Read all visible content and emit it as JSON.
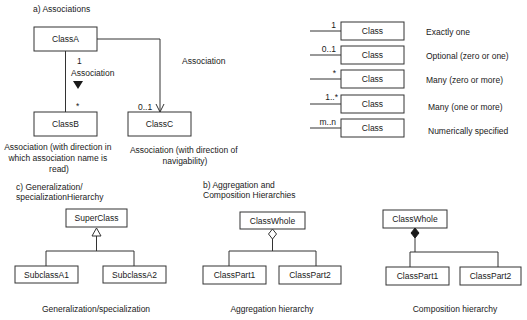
{
  "sections": {
    "associations": {
      "title": "a) Associations",
      "classA": "ClassA",
      "classB": "ClassB",
      "classC": "ClassC",
      "ab_multiplicity_top": "1",
      "ab_multiplicity_bottom": "*",
      "ab_association_label": "Association",
      "ac_association_label": "Association",
      "ac_multiplicity": "0..1",
      "caption_left": [
        "Association (with direction in",
        "which association name is",
        "read)"
      ],
      "caption_right": [
        "Association (with direction of",
        "navigability)"
      ]
    },
    "multiplicities": {
      "rows": [
        {
          "multiplicity": "1",
          "class": "Class",
          "meaning": "Exactly one"
        },
        {
          "multiplicity": "0..1",
          "class": "Class",
          "meaning": "Optional (zero or one)"
        },
        {
          "multiplicity": "*",
          "class": "Class",
          "meaning": "Many (zero or more)"
        },
        {
          "multiplicity": "1..*",
          "class": "Class",
          "meaning": "Many (one or more)"
        },
        {
          "multiplicity": "m..n",
          "class": "Class",
          "meaning": "Numerically specified"
        }
      ]
    },
    "generalization": {
      "title": [
        "c) Generalization/",
        "specializationHierarchy"
      ],
      "superclass": "SuperClass",
      "subclass1": "SubclassA1",
      "subclass2": "SubclassA2",
      "caption": "Generalization/specialization"
    },
    "aggregation": {
      "title": [
        "b) Aggregation and",
        "Composition Hierarchies"
      ],
      "whole": "ClassWhole",
      "part1": "ClassPart1",
      "part2": "ClassPart2",
      "caption": "Aggregation hierarchy"
    },
    "composition": {
      "whole": "ClassWhole",
      "part1": "ClassPart1",
      "part2": "ClassPart2",
      "caption": "Composition hierarchy"
    }
  },
  "colors": {
    "line": "#333333",
    "text": "#1a1a1a",
    "background": "#ffffff"
  }
}
